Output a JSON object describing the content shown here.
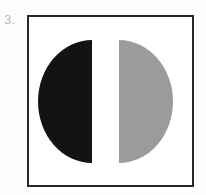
{
  "figure": {
    "label": "3.",
    "frame": {
      "border_color": "#262626",
      "background_color": "#ffffff",
      "border_width_px": 2
    },
    "shapes": [
      {
        "name": "left-half-disc",
        "shape": "semicircle",
        "fill_color": "#131313",
        "fill_name": "black",
        "flat_edge_side": "right",
        "arc_side": "left"
      },
      {
        "name": "right-half-disc",
        "shape": "semicircle",
        "fill_color": "#9b9b9b",
        "fill_name": "gray",
        "flat_edge_side": "left",
        "arc_side": "right"
      }
    ],
    "page_background_color": "#fdfdfc",
    "label_color": "#b9b9b9"
  }
}
